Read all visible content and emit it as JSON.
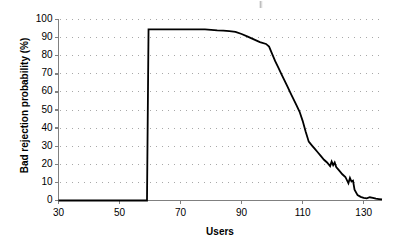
{
  "chart_data": {
    "type": "line",
    "title": "",
    "xlabel": "Users",
    "ylabel": "Bad rejection probability (%)",
    "xlim": [
      30,
      136
    ],
    "ylim": [
      0,
      100
    ],
    "xticks": [
      30,
      50,
      70,
      90,
      110,
      130
    ],
    "yticks": [
      0,
      10,
      20,
      30,
      40,
      50,
      60,
      70,
      80,
      90,
      100
    ],
    "grid": "horizontal-dotted",
    "legend": "none",
    "series": [
      {
        "name": "Bad rejection probability",
        "color": "#000000",
        "x": [
          30,
          59,
          59.5,
          62,
          66,
          70,
          74,
          78,
          80,
          82,
          84,
          86,
          88,
          90,
          92,
          94,
          96,
          98,
          99,
          100,
          101,
          102,
          103,
          104,
          105,
          106,
          107,
          108,
          109,
          110,
          111,
          112,
          113,
          114,
          115,
          116,
          117,
          118,
          119,
          119.5,
          120,
          120.5,
          121,
          122,
          123,
          124,
          125,
          125.5,
          126,
          126.5,
          127,
          128,
          129,
          130,
          131,
          132,
          133,
          134,
          135,
          136
        ],
        "y": [
          0,
          0,
          94.5,
          94.5,
          94.5,
          94.5,
          94.5,
          94.5,
          94.3,
          94.0,
          93.8,
          93.6,
          93.2,
          92.0,
          90.5,
          89.0,
          87.5,
          86.5,
          85.0,
          81.0,
          77.0,
          73.5,
          70.0,
          66.5,
          63.0,
          59.5,
          56.0,
          52.5,
          49.0,
          44.0,
          38.0,
          32.5,
          30.5,
          28.5,
          26.5,
          24.5,
          22.5,
          21.0,
          19.0,
          21.5,
          19.5,
          21.0,
          18.5,
          16.5,
          14.5,
          13.0,
          9.5,
          12.5,
          10.5,
          11.0,
          6.0,
          3.0,
          2.0,
          1.5,
          1.2,
          1.8,
          1.5,
          1.0,
          0.8,
          0.6
        ]
      }
    ]
  },
  "axes": {
    "y_tick_labels": [
      "100",
      "90",
      "80",
      "70",
      "60",
      "50",
      "40",
      "30",
      "20",
      "10",
      "0"
    ],
    "x_tick_labels": [
      "30",
      "50",
      "70",
      "90",
      "110",
      "130"
    ],
    "x_title": "Users",
    "y_title": "Bad rejection probability (%)"
  },
  "colors": {
    "line": "#000000",
    "axis": "#808080",
    "grid": "#a8a8a8",
    "background": "#ffffff"
  }
}
